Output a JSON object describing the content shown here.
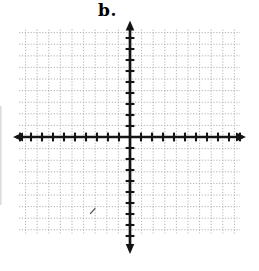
{
  "figure": {
    "label": "b."
  },
  "colors": {
    "background": "#ffffff",
    "grid": "#a3a3a3",
    "axis": "#141414",
    "label": "#000000",
    "stray_mark": "#5f5f5f",
    "scan_artifact": "#c4c4c4"
  },
  "chart_data": {
    "type": "scatter",
    "title": "b.",
    "series": [],
    "xlabel": "",
    "ylabel": "",
    "x_axis": {
      "min": -10,
      "max": 10,
      "tick_step": 1,
      "ticks_per_side": 10,
      "numeric_labels_visible": false,
      "arrowheads": "both"
    },
    "y_axis": {
      "min": -9,
      "max": 9,
      "tick_step": 1,
      "ticks_per_side": 9,
      "numeric_labels_visible": false,
      "arrowheads": "both"
    },
    "grid": {
      "visible": true,
      "style": "dotted",
      "vertical_lines": 19,
      "horizontal_lines": 18
    },
    "legend": {
      "visible": false
    },
    "annotations": [
      {
        "type": "stray-pen-mark",
        "location": "third quadrant"
      }
    ]
  }
}
